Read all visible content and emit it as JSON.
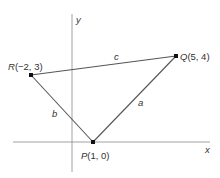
{
  "diagram": {
    "type": "coordinate-plane-triangle",
    "axes": {
      "x_label": "x",
      "y_label": "y"
    },
    "points": [
      {
        "id": "R",
        "name": "R",
        "coords": "(−2, 3)",
        "x": -2,
        "y": 3
      },
      {
        "id": "Q",
        "name": "Q",
        "coords": "(5, 4)",
        "x": 5,
        "y": 4
      },
      {
        "id": "P",
        "name": "P",
        "coords": "(1, 0)",
        "x": 1,
        "y": 0
      }
    ],
    "sides": [
      {
        "id": "a",
        "label": "a",
        "from": "P",
        "to": "Q"
      },
      {
        "id": "b",
        "label": "b",
        "from": "R",
        "to": "P"
      },
      {
        "id": "c",
        "label": "c",
        "from": "R",
        "to": "Q"
      }
    ],
    "colors": {
      "axis": "#8a8a8a",
      "edge": "#555555",
      "point": "#111111",
      "text": "#333333"
    }
  }
}
